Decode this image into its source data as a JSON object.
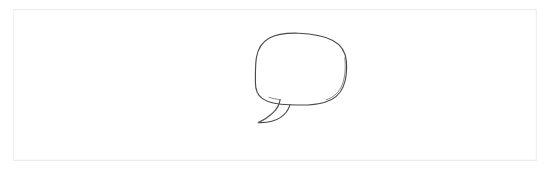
{
  "canvas": {
    "width": 553,
    "height": 172,
    "background_color": "#ffffff",
    "description": "Blank white drawing canvas with a thin light gray rectangular border frame"
  },
  "frame": {
    "border_color": "#f0f0f0",
    "fill_color": "#ffffff",
    "x": 13,
    "y": 9,
    "width": 524,
    "height": 152
  },
  "drawing": {
    "name": "speech-bubble",
    "label": "Speech bubble",
    "style": "hand-drawn sketch outline",
    "stroke_color": "#4a4a4a",
    "fill_color": "none",
    "stroke_width": 1.15,
    "bounds": {
      "x": 255,
      "y": 33,
      "width": 92,
      "height": 90
    },
    "parts": [
      {
        "name": "bubble-body",
        "shape": "rounded-oval",
        "center_x": 301,
        "center_y": 71,
        "radius_x": 45,
        "radius_y": 38
      },
      {
        "name": "bubble-tail",
        "shape": "hooked-point",
        "attach_x": 290,
        "attach_y": 104,
        "tip_x": 257,
        "tip_y": 122
      }
    ]
  },
  "accessibility": {
    "alt_text": "A simple hand-drawn speech bubble outline centered on a blank white page"
  }
}
